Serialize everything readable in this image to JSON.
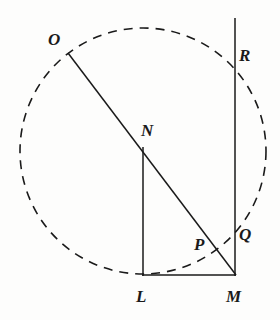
{
  "figure": {
    "type": "geometry-diagram",
    "width": 280,
    "height": 320,
    "background_color": "#fdfdfc",
    "stroke_color": "#1a1a1a",
    "label_color": "#1a1a1a"
  },
  "circle": {
    "name": "dashed-circle",
    "center_x": 143,
    "center_y": 151,
    "radius": 123,
    "style": "dashed",
    "dash_pattern": "9 7",
    "stroke_width": 1.6
  },
  "points": {
    "O": {
      "label": "O",
      "x": 68,
      "y": 53,
      "label_x": 48,
      "label_y": 31
    },
    "N": {
      "label": "N",
      "x": 143,
      "y": 147,
      "label_x": 141,
      "label_y": 122
    },
    "L": {
      "label": "L",
      "x": 143,
      "y": 275,
      "label_x": 136,
      "label_y": 288
    },
    "M": {
      "label": "M",
      "x": 236,
      "y": 275,
      "label_x": 226,
      "label_y": 288
    },
    "P": {
      "label": "P",
      "x": 215,
      "y": 249,
      "label_x": 194,
      "label_y": 236
    },
    "Q": {
      "label": "Q",
      "x": 235,
      "y": 240,
      "label_x": 239,
      "label_y": 226
    },
    "R": {
      "label": "R",
      "x": 235,
      "y": 65,
      "label_x": 239,
      "label_y": 47
    }
  },
  "segments": [
    {
      "name": "segment-OM",
      "from": "O",
      "to": "M",
      "x1": 68,
      "y1": 53,
      "x2": 236,
      "y2": 275,
      "style": "solid"
    },
    {
      "name": "segment-NL",
      "from": "N",
      "to": "L",
      "x1": 143,
      "y1": 147,
      "x2": 143,
      "y2": 275,
      "style": "solid"
    },
    {
      "name": "segment-LM",
      "from": "L",
      "to": "M",
      "x1": 143,
      "y1": 275,
      "x2": 236,
      "y2": 275,
      "style": "solid"
    },
    {
      "name": "line-vertical-RQM",
      "from": "top",
      "to": "M",
      "x1": 235,
      "y1": 18,
      "x2": 235,
      "y2": 276,
      "style": "solid"
    }
  ],
  "labels_order": [
    "O",
    "R",
    "N",
    "P",
    "Q",
    "L",
    "M"
  ]
}
